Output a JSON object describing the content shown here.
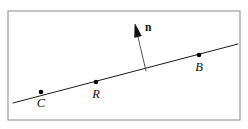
{
  "figure": {
    "background_color": "#ffffff",
    "frame": {
      "x": 8,
      "y": 11,
      "width": 232,
      "height": 109,
      "stroke_color": "#8a8a8a",
      "stroke_width": 1
    },
    "line": {
      "label": "line",
      "x1": 13,
      "y1": 103,
      "x2": 238,
      "y2": 44,
      "stroke_color": "#1a1a1a",
      "stroke_width": 1
    },
    "points": [
      {
        "label": "C",
        "x": 41,
        "y": 92,
        "label_x": 41,
        "label_y": 107,
        "radius": 2.3
      },
      {
        "label": "R",
        "x": 96,
        "y": 82,
        "label_x": 96,
        "label_y": 98,
        "radius": 2.3
      },
      {
        "label": "B",
        "x": 199,
        "y": 55,
        "label_x": 199,
        "label_y": 71,
        "radius": 2.3
      }
    ],
    "normal_vector": {
      "label": "n",
      "tail_x": 146,
      "tail_y": 71,
      "head_x": 135,
      "head_y": 24,
      "shaft_stroke_color": "#555555",
      "shaft_stroke_width": 1,
      "head_fill_color": "#111111",
      "head_length": 13,
      "head_width": 7,
      "label_x": 145,
      "label_y": 31
    }
  }
}
